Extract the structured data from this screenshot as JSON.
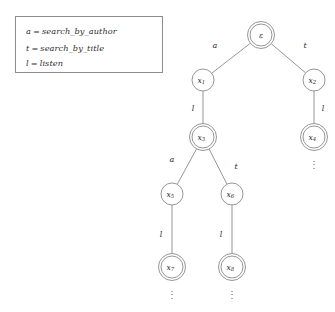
{
  "figure": {
    "kind": "prefix-tree-automaton",
    "background_color": "#ffffff",
    "stroke_color": "#8a8a8a",
    "text_color": "#2e2e2e"
  },
  "legend": {
    "entries": [
      {
        "symbol": "a",
        "equals": "=",
        "meaning": "search_by_author"
      },
      {
        "symbol": "t",
        "equals": "=",
        "meaning": "search_by_title"
      },
      {
        "symbol": "l",
        "equals": "=",
        "meaning": "listen"
      }
    ]
  },
  "tree": {
    "nodes": [
      {
        "id": "root",
        "label": "ε",
        "sub": "",
        "x": 261,
        "y": 35,
        "double": true,
        "dots_below": false
      },
      {
        "id": "x1",
        "label": "x",
        "sub": "1",
        "x": 203,
        "y": 80,
        "double": false,
        "dots_below": false
      },
      {
        "id": "x2",
        "label": "x",
        "sub": "2",
        "x": 314,
        "y": 80,
        "double": false,
        "dots_below": false
      },
      {
        "id": "x3",
        "label": "x",
        "sub": "3",
        "x": 203,
        "y": 137,
        "double": true,
        "dots_below": false
      },
      {
        "id": "x4",
        "label": "x",
        "sub": "4",
        "x": 314,
        "y": 137,
        "double": true,
        "dots_below": true
      },
      {
        "id": "x5",
        "label": "x",
        "sub": "5",
        "x": 172,
        "y": 194,
        "double": false,
        "dots_below": false
      },
      {
        "id": "x6",
        "label": "x",
        "sub": "6",
        "x": 232,
        "y": 194,
        "double": false,
        "dots_below": false
      },
      {
        "id": "x7",
        "label": "x",
        "sub": "7",
        "x": 172,
        "y": 267,
        "double": true,
        "dots_below": true
      },
      {
        "id": "x8",
        "label": "x",
        "sub": "8",
        "x": 232,
        "y": 267,
        "double": true,
        "dots_below": true
      }
    ],
    "edges": [
      {
        "from": "root",
        "to": "x1",
        "label": "a",
        "label_x": 215,
        "label_y": 45
      },
      {
        "from": "root",
        "to": "x2",
        "label": "t",
        "label_x": 305,
        "label_y": 45
      },
      {
        "from": "x1",
        "to": "x3",
        "label": "l",
        "label_x": 193,
        "label_y": 108
      },
      {
        "from": "x2",
        "to": "x4",
        "label": "l",
        "label_x": 323,
        "label_y": 108
      },
      {
        "from": "x3",
        "to": "x5",
        "label": "a",
        "label_x": 172,
        "label_y": 159
      },
      {
        "from": "x3",
        "to": "x6",
        "label": "t",
        "label_x": 236,
        "label_y": 166
      },
      {
        "from": "x5",
        "to": "x7",
        "label": "l",
        "label_x": 161,
        "label_y": 234
      },
      {
        "from": "x6",
        "to": "x8",
        "label": "l",
        "label_x": 221,
        "label_y": 234
      }
    ],
    "node_radius": 11,
    "node_radius_outer": 13.5,
    "ellipsis_glyph": "⋮"
  }
}
